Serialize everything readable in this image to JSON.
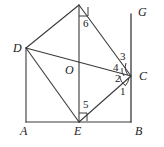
{
  "figure": {
    "type": "geometry-diagram",
    "stroke_color": "#3a3a3a",
    "background_color": "#ffffff",
    "label_color": "#1a1a1a"
  },
  "points": [
    {
      "id": "A",
      "label": "A",
      "x": 26,
      "y": 122,
      "label_x": 21,
      "label_y": 126
    },
    {
      "id": "B",
      "label": "B",
      "x": 131,
      "y": 122,
      "label_x": 135,
      "label_y": 126
    },
    {
      "id": "C",
      "label": "C",
      "x": 131,
      "y": 76,
      "label_x": 139,
      "label_y": 70
    },
    {
      "id": "D",
      "label": "D",
      "x": 26,
      "y": 48,
      "label_x": 13,
      "label_y": 42
    },
    {
      "id": "E",
      "label": "E",
      "x": 79,
      "y": 122,
      "label_x": 75,
      "label_y": 126
    },
    {
      "id": "F",
      "label": "",
      "x": 79,
      "y": 5,
      "label_x": 0,
      "label_y": 0
    },
    {
      "id": "G",
      "label": "G",
      "x": 131,
      "y": 14,
      "label_x": 138,
      "label_y": 5
    },
    {
      "id": "O",
      "label": "O",
      "x": 79,
      "y": 70,
      "label_x": 66,
      "label_y": 64
    }
  ],
  "segments": [
    {
      "name": "segment-AB",
      "from": "A",
      "to": "B"
    },
    {
      "name": "segment-AD",
      "from": "A",
      "to": "D"
    },
    {
      "name": "segment-DF",
      "from": "D",
      "to": "F"
    },
    {
      "name": "segment-FC",
      "from": "F",
      "to": "C"
    },
    {
      "name": "segment-DC",
      "from": "D",
      "to": "C"
    },
    {
      "name": "segment-DE",
      "from": "D",
      "to": "E"
    },
    {
      "name": "segment-EC",
      "from": "E",
      "to": "C"
    },
    {
      "name": "segment-FE",
      "from": "F",
      "to": "E"
    },
    {
      "name": "segment-GB",
      "from": "G",
      "to": "B"
    }
  ],
  "angles": [
    {
      "id": "1",
      "label": "1",
      "vertex": "C",
      "label_x": 120,
      "label_y": 86,
      "marker": "arc"
    },
    {
      "id": "2",
      "label": "2",
      "vertex": "C",
      "label_x": 118,
      "label_y": 73,
      "marker": "arc"
    },
    {
      "id": "3",
      "label": "3",
      "vertex": "C",
      "label_x": 120,
      "label_y": 53,
      "marker": "arc"
    },
    {
      "id": "4",
      "label": "4",
      "vertex": "C",
      "label_x": 114,
      "label_y": 63,
      "marker": "arc"
    },
    {
      "id": "5",
      "label": "5",
      "vertex": "E",
      "label_x": 83,
      "label_y": 100,
      "marker": "right-angle"
    },
    {
      "id": "6",
      "label": "6",
      "vertex": "F",
      "label_x": 83,
      "label_y": 19,
      "marker": "right-angle"
    }
  ],
  "right_angle_markers": [
    {
      "name": "right-angle-marker-at-F",
      "vertex": "F",
      "description": "square marker between FE and FC at apex F"
    },
    {
      "name": "right-angle-marker-at-E",
      "vertex": "E",
      "description": "square marker between EF and EC at E"
    }
  ]
}
